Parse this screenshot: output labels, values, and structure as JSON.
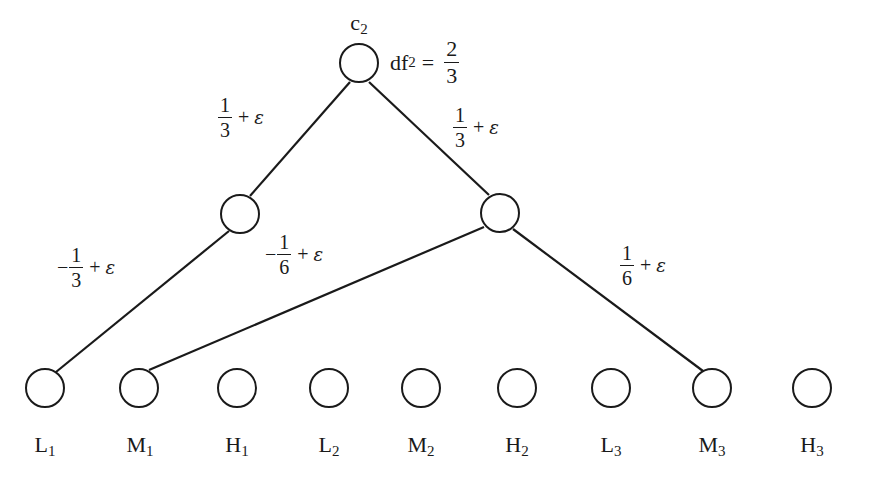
{
  "diagram": {
    "root": {
      "id": "c2",
      "label": "c",
      "subscript": "2",
      "df_label": "df",
      "df_subscript": "2",
      "df_eq": "=",
      "df_num": "2",
      "df_den": "3"
    },
    "edges": [
      {
        "from": "c2",
        "to": "left",
        "sign": "",
        "num": "1",
        "den": "3",
        "plus": "+",
        "eps": "ε"
      },
      {
        "from": "c2",
        "to": "right",
        "sign": "",
        "num": "1",
        "den": "3",
        "plus": "+",
        "eps": "ε"
      },
      {
        "from": "left",
        "to": "L1",
        "sign": "−",
        "num": "1",
        "den": "3",
        "plus": "+",
        "eps": "ε"
      },
      {
        "from": "right",
        "to": "M1",
        "sign": "−",
        "num": "1",
        "den": "6",
        "plus": "+",
        "eps": "ε"
      },
      {
        "from": "right",
        "to": "M3",
        "sign": "",
        "num": "1",
        "den": "6",
        "plus": "+",
        "eps": "ε"
      }
    ],
    "leaves": [
      {
        "letter": "L",
        "sub": "1"
      },
      {
        "letter": "M",
        "sub": "1"
      },
      {
        "letter": "H",
        "sub": "1"
      },
      {
        "letter": "L",
        "sub": "2"
      },
      {
        "letter": "M",
        "sub": "2"
      },
      {
        "letter": "H",
        "sub": "2"
      },
      {
        "letter": "L",
        "sub": "3"
      },
      {
        "letter": "M",
        "sub": "3"
      },
      {
        "letter": "H",
        "sub": "3"
      }
    ],
    "colors": {
      "stroke": "#1a1a1a",
      "background": "#ffffff"
    }
  }
}
